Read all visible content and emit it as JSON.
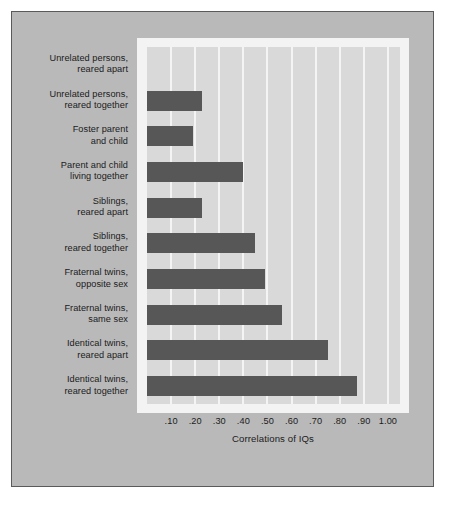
{
  "chart_data": {
    "type": "bar",
    "orientation": "horizontal",
    "title": "",
    "subtitle": "",
    "xlabel": "Correlations of IQs",
    "ylabel": "",
    "xlim": [
      0.0,
      1.05
    ],
    "xticks": [
      0.1,
      0.2,
      0.3,
      0.4,
      0.5,
      0.6,
      0.7,
      0.8,
      0.9,
      1.0
    ],
    "xticklabels": [
      ".10",
      ".20",
      ".30",
      ".40",
      ".50",
      ".60",
      ".70",
      ".80",
      ".90",
      "1.00"
    ],
    "grid": "vertical",
    "legend": "none",
    "categories": [
      "Unrelated persons, reared apart",
      "Unrelated persons, reared together",
      "Foster parent and child",
      "Parent and child living together",
      "Siblings, reared apart",
      "Siblings, reared together",
      "Fraternal twins, opposite sex",
      "Fraternal twins, same sex",
      "Identical twins, reared apart",
      "Identical twins, reared together"
    ],
    "values": [
      0.0,
      0.23,
      0.19,
      0.4,
      0.23,
      0.45,
      0.49,
      0.56,
      0.75,
      0.87
    ],
    "bar_color": "#575757"
  },
  "chart": {
    "axis_title": "Correlations of IQs",
    "tick_labels": [
      ".10",
      ".20",
      ".30",
      ".40",
      ".50",
      ".60",
      ".70",
      ".80",
      ".90",
      "1.00"
    ],
    "rows": [
      {
        "line1": "Unrelated persons,",
        "line2": "reared apart",
        "value": 0.0
      },
      {
        "line1": "Unrelated persons,",
        "line2": "reared together",
        "value": 0.23
      },
      {
        "line1": "Foster parent",
        "line2": "and child",
        "value": 0.19
      },
      {
        "line1": "Parent and child",
        "line2": "living together",
        "value": 0.4
      },
      {
        "line1": "Siblings,",
        "line2": "reared apart",
        "value": 0.23
      },
      {
        "line1": "Siblings,",
        "line2": "reared together",
        "value": 0.45
      },
      {
        "line1": "Fraternal twins,",
        "line2": "opposite sex",
        "value": 0.49
      },
      {
        "line1": "Fraternal twins,",
        "line2": "same sex",
        "value": 0.56
      },
      {
        "line1": "Identical twins,",
        "line2": "reared apart",
        "value": 0.75
      },
      {
        "line1": "Identical twins,",
        "line2": "reared together",
        "value": 0.87
      }
    ]
  },
  "colors": {
    "page_background": "#ffffff",
    "card_background": "#b9b9b9",
    "card_border": "#5a5a5a",
    "plot_frame": "#f3f3f3",
    "plot_background": "#d9d9d9",
    "gridline": "#f4f4f4",
    "bar": "#575757",
    "text": "#1b1b1b"
  }
}
